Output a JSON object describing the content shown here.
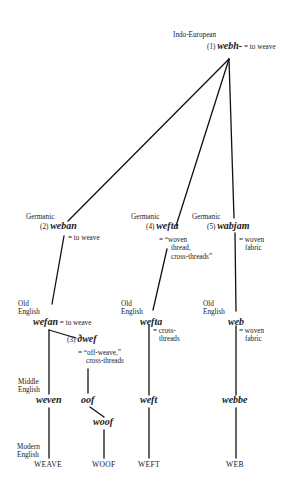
{
  "diagram": {
    "type": "etymology-tree",
    "root": {
      "stage": "Indo-European",
      "number": "(1)",
      "word": "webh-",
      "gloss": "= to weave"
    },
    "germanic": [
      {
        "stage": "Germanic",
        "number": "(2)",
        "word": "weban",
        "gloss": "= to weave"
      },
      {
        "stage": "Germanic",
        "number": "(4)",
        "word": "wefta",
        "gloss_lines": [
          "= “woven",
          "thread,",
          "cross-threads”"
        ]
      },
      {
        "stage": "Germanic",
        "number": "(5)",
        "word": "wabjam",
        "gloss_lines": [
          "= woven",
          "fabric"
        ]
      }
    ],
    "old_english": [
      {
        "stage_lines": [
          "Old",
          "English"
        ],
        "word": "wefan",
        "gloss": "= to weave"
      },
      {
        "number": "(3)",
        "word": "ðwef",
        "gloss_lines": [
          "= “off-weave,”",
          "cross-threads"
        ]
      },
      {
        "stage_lines": [
          "Old",
          "English"
        ],
        "word": "wefta",
        "gloss_lines": [
          "= cross-",
          "threads"
        ]
      },
      {
        "stage_lines": [
          "Old",
          "English"
        ],
        "word": "web",
        "gloss_lines": [
          "= woven",
          "fabric"
        ]
      }
    ],
    "middle_english": {
      "stage_lines": [
        "Middle",
        "English"
      ],
      "words": [
        "weven",
        "oof",
        "woof",
        "weft",
        "webbe"
      ]
    },
    "modern_english": {
      "stage_lines": [
        "Modern",
        "English"
      ],
      "words": [
        "WEAVE",
        "WOOF",
        "WEFT",
        "WEB"
      ]
    }
  }
}
